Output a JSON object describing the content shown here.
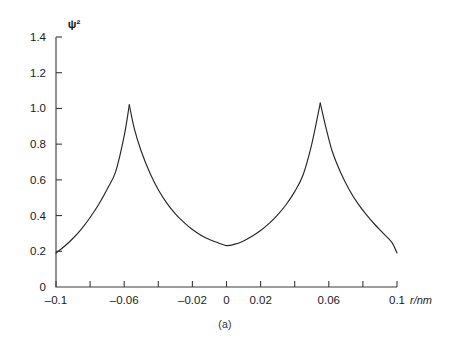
{
  "figure": {
    "caption": "(a)",
    "y_axis_label": "ψ²",
    "x_axis_label": "r/nm"
  },
  "chart_data": {
    "type": "line",
    "title": "",
    "subtitle": "",
    "caption": "(a)",
    "xlabel": "r/nm",
    "ylabel": "ψ²",
    "xlim": [
      -0.1,
      0.1
    ],
    "ylim": [
      0,
      1.4
    ],
    "grid": false,
    "legend": null,
    "x_ticks": [
      -0.1,
      -0.08,
      -0.06,
      -0.04,
      -0.02,
      0,
      0.02,
      0.04,
      0.06,
      0.08,
      0.1
    ],
    "x_tick_labels": [
      "–0.1",
      "",
      "–0.06",
      "",
      "–0.02",
      "0",
      "0.02",
      "",
      "0.06",
      "",
      "0.1"
    ],
    "y_ticks": [
      0,
      0.2,
      0.4,
      0.6,
      0.8,
      1.0,
      1.2,
      1.4
    ],
    "y_tick_labels": [
      "0",
      "0.2",
      "0.4",
      "0.6",
      "0.8",
      "1.0",
      "1.2",
      "1.4"
    ],
    "nuclei_positions": [
      -0.057,
      0.055
    ],
    "peak_values": [
      1.02,
      1.03
    ],
    "minimum": {
      "x": 0.0,
      "y": 0.23
    },
    "endpoints": [
      {
        "x": -0.1,
        "y": 0.19
      },
      {
        "x": 0.1,
        "y": 0.19
      }
    ],
    "series": [
      {
        "name": "ψ²",
        "color": "#262626",
        "x": [
          -0.1,
          -0.095,
          -0.09,
          -0.085,
          -0.08,
          -0.075,
          -0.07,
          -0.065,
          -0.06,
          -0.057,
          -0.054,
          -0.05,
          -0.045,
          -0.04,
          -0.035,
          -0.03,
          -0.025,
          -0.02,
          -0.015,
          -0.01,
          -0.005,
          0.0,
          0.005,
          0.01,
          0.015,
          0.02,
          0.025,
          0.03,
          0.035,
          0.04,
          0.045,
          0.05,
          0.055,
          0.058,
          0.062,
          0.067,
          0.072,
          0.077,
          0.082,
          0.087,
          0.092,
          0.097,
          0.1
        ],
        "y": [
          0.19,
          0.228,
          0.273,
          0.326,
          0.389,
          0.462,
          0.548,
          0.646,
          0.846,
          1.02,
          0.884,
          0.76,
          0.64,
          0.545,
          0.47,
          0.41,
          0.362,
          0.322,
          0.29,
          0.266,
          0.248,
          0.232,
          0.24,
          0.258,
          0.284,
          0.316,
          0.356,
          0.404,
          0.462,
          0.534,
          0.63,
          0.8,
          1.03,
          0.905,
          0.76,
          0.64,
          0.545,
          0.468,
          0.405,
          0.35,
          0.3,
          0.25,
          0.19
        ]
      }
    ]
  }
}
